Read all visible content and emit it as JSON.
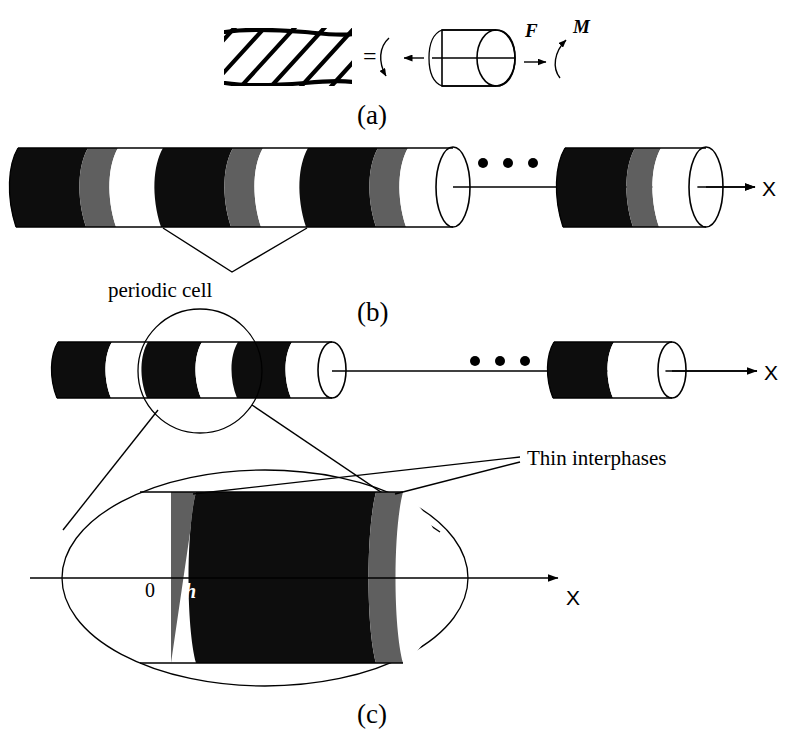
{
  "figure": {
    "background_color": "#ffffff",
    "ink_color": "#000000",
    "matrix_color": "#0d0d0d",
    "interphase_color": "#5f5f5f",
    "fiber_color": "#ffffff"
  },
  "panels": {
    "a": {
      "caption": "(a)",
      "equals_sign": "=",
      "force_label": "F",
      "moment_label": "M",
      "rope_strands": 5,
      "icons": {
        "rope": "twisted-rope-icon",
        "cylinder": "cylinder-icon",
        "force_arrow": "straight-arrow-icon",
        "moment_arrow": "curved-arrow-icon"
      }
    },
    "b": {
      "caption": "(b)",
      "axis_label": "X",
      "annotation": "periodic cell",
      "ellipsis": "• • •",
      "cell_count": 3,
      "layer_sequence": [
        "matrix",
        "interphase",
        "fiber"
      ]
    },
    "c": {
      "caption": "(c)",
      "axis_label": "X",
      "annotation": "Thin interphases",
      "ellipsis": "• • •",
      "origin_label": "0",
      "thickness_label": "h",
      "cell_count": 3
    }
  }
}
